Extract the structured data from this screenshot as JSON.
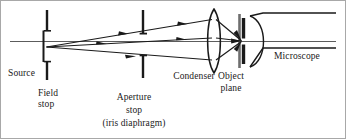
{
  "figure": {
    "width": 346,
    "height": 139,
    "background_color": "#ffffff",
    "ink_color": "#1a1a1a",
    "border_color": "#9a9a9a"
  },
  "labels": {
    "source": "Source",
    "field_stop_line1": "Field",
    "field_stop_line2": "stop",
    "aperture_stop_line1": "Aperture",
    "aperture_stop_line2": "stop",
    "aperture_stop_line3": "(iris diaphragm)",
    "condenser": "Condenser",
    "object_plane_line1": "Object",
    "object_plane_line2": "plane",
    "microscope": "Microscope"
  },
  "components": [
    {
      "name": "source",
      "label": "Source",
      "x": 46,
      "y": 47
    },
    {
      "name": "field-stop",
      "label": "Field stop",
      "x": 47,
      "y": 40
    },
    {
      "name": "aperture-stop",
      "label": "Aperture stop",
      "x": 143,
      "y": 40
    },
    {
      "name": "condenser",
      "label": "Condenser",
      "x": 214,
      "y": 38
    },
    {
      "name": "object-plane",
      "label": "Object plane",
      "x": 243,
      "y": 38
    },
    {
      "name": "microscope",
      "label": "Microscope",
      "x": 300,
      "y": 38
    }
  ],
  "rays": {
    "count": 3,
    "origin": {
      "x": 46,
      "y": 47
    },
    "convergence": {
      "x": 241,
      "y": 41
    },
    "arrow_marker": "filled-triangle",
    "descriptions": [
      "upper ray rising from source through aperture stop top to condenser",
      "axial ray horizontal from source through condenser to object plane",
      "lower ray descending from source through aperture stop bottom to condenser"
    ]
  },
  "axis": {
    "name": "optical-axis",
    "y": 41,
    "x_start": 10,
    "x_end": 336
  }
}
